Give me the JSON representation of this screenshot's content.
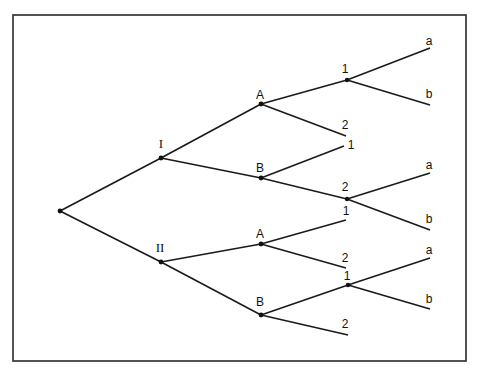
{
  "diagram": {
    "type": "tree",
    "orientation": "left-to-right",
    "colors": {
      "line": "#1a1a1a",
      "frame": "#2a2a2a",
      "background": "#ffffff"
    },
    "root": {
      "id": "root",
      "label": ""
    },
    "level1": [
      {
        "id": "I",
        "label": "I"
      },
      {
        "id": "II",
        "label": "II"
      }
    ],
    "level2": [
      {
        "id": "I-A",
        "parent": "I",
        "label": "A"
      },
      {
        "id": "I-B",
        "parent": "I",
        "label": "B"
      },
      {
        "id": "II-A",
        "parent": "II",
        "label": "A"
      },
      {
        "id": "II-B",
        "parent": "II",
        "label": "B"
      }
    ],
    "level3": [
      {
        "id": "I-A-1",
        "parent": "I-A",
        "label": "1"
      },
      {
        "id": "I-A-2",
        "parent": "I-A",
        "label": "2"
      },
      {
        "id": "I-B-1",
        "parent": "I-B",
        "label": "1"
      },
      {
        "id": "I-B-2",
        "parent": "I-B",
        "label": "2"
      },
      {
        "id": "II-A-1",
        "parent": "II-A",
        "label": "1"
      },
      {
        "id": "II-A-2",
        "parent": "II-A",
        "label": "2"
      },
      {
        "id": "II-B-1",
        "parent": "II-B",
        "label": "1"
      },
      {
        "id": "II-B-2",
        "parent": "II-B",
        "label": "2"
      }
    ],
    "level4": [
      {
        "id": "I-A-1-a",
        "parent": "I-A-1",
        "label": "a"
      },
      {
        "id": "I-A-1-b",
        "parent": "I-A-1",
        "label": "b"
      },
      {
        "id": "I-B-2-a",
        "parent": "I-B-2",
        "label": "a"
      },
      {
        "id": "I-B-2-b",
        "parent": "I-B-2",
        "label": "b"
      },
      {
        "id": "II-B-1-a",
        "parent": "II-B-1",
        "label": "a"
      },
      {
        "id": "II-B-1-b",
        "parent": "II-B-1",
        "label": "b"
      }
    ]
  }
}
